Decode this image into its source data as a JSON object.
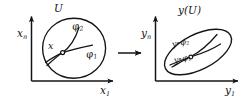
{
  "figure": {
    "background_color": "#ffffff",
    "ink_color": "#141414"
  },
  "left_panel": {
    "name": "source-space",
    "y_axis_label": "x",
    "y_axis_sub": "n",
    "x_axis_label": "x",
    "x_axis_sub": "1",
    "region_label": "U",
    "point_label": "x",
    "curves": [
      {
        "label": "φ",
        "sub": "2",
        "name": "curve-phi-2"
      },
      {
        "label": "φ",
        "sub": "1",
        "name": "curve-phi-1"
      }
    ]
  },
  "map_arrow": {
    "name": "mapping-arrow",
    "direction": "right"
  },
  "right_panel": {
    "name": "target-space",
    "y_axis_label": "y",
    "y_axis_sub": "n",
    "x_axis_label": "y",
    "x_axis_sub": "1",
    "region_label": "y(U)",
    "curves": [
      {
        "label": "y∘φ",
        "sub": "2",
        "name": "curve-y-phi-2"
      },
      {
        "label": "y∘φ",
        "sub": "1",
        "name": "curve-y-phi-1"
      }
    ]
  }
}
